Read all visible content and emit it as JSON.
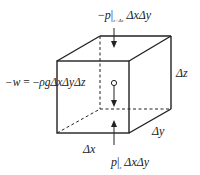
{
  "diagram": {
    "labels": {
      "top_force": {
        "sign": "−",
        "var": "p",
        "bar": "|",
        "sub": "z+Δz",
        "area": "ΔxΔy"
      },
      "bottom_force": {
        "var": "p",
        "bar": "|",
        "sub": "z",
        "area": "ΔxΔy"
      },
      "weight": {
        "lhs": "−w",
        "eq": " = −",
        "rho": "ρ",
        "g": "g",
        "rest": "ΔxΔyΔz"
      },
      "dx": "Δx",
      "dy": "Δy",
      "dz": "Δz"
    },
    "colors": {
      "stroke": "#222222",
      "background": "#ffffff"
    }
  }
}
